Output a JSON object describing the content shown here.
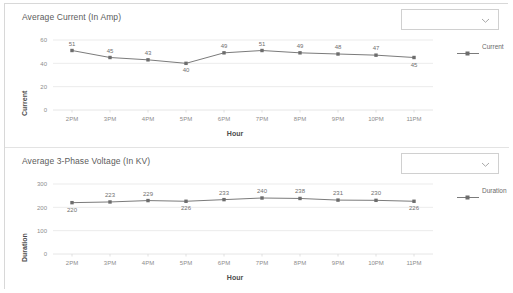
{
  "panels": [
    {
      "id": "average-current",
      "title": "Average Current (In Amp)",
      "dropdown": {
        "value": "",
        "icon": "chevron-down-icon"
      },
      "legend": {
        "label": "Current"
      },
      "chart_data": {
        "type": "line",
        "title": "Average Current (In Amp)",
        "xlabel": "Hour",
        "ylabel": "Current",
        "categories": [
          "2PM",
          "3PM",
          "4PM",
          "5PM",
          "6PM",
          "7PM",
          "8PM",
          "9PM",
          "10PM",
          "11PM"
        ],
        "series": [
          {
            "name": "Current",
            "values": [
              51,
              45,
              43,
              40,
              49,
              51,
              49,
              48,
              47,
              45
            ]
          }
        ],
        "data_labels": [
          "51",
          "45",
          "43",
          "40",
          "49",
          "51",
          "49",
          "48",
          "47",
          "45"
        ],
        "data_label_positions": [
          "above",
          "above",
          "above",
          "below",
          "above",
          "above",
          "above",
          "above",
          "above",
          "below"
        ],
        "yticks": [
          "0",
          "20",
          "40",
          "60"
        ],
        "ytick_values": [
          0,
          20,
          40,
          60
        ],
        "ylim": [
          0,
          60
        ],
        "grid": true,
        "legend_position": "right",
        "color": "#7b7b7b"
      }
    },
    {
      "id": "average-3-phase-voltage",
      "title": "Average 3-Phase Voltage (In KV)",
      "dropdown": {
        "value": "",
        "icon": "chevron-down-icon"
      },
      "legend": {
        "label": "Duration"
      },
      "chart_data": {
        "type": "line",
        "title": "Average 3-Phase Voltage (In KV)",
        "xlabel": "Hour",
        "ylabel": "Duration",
        "categories": [
          "2PM",
          "3PM",
          "4PM",
          "5PM",
          "6PM",
          "7PM",
          "8PM",
          "9PM",
          "10PM",
          "11PM"
        ],
        "series": [
          {
            "name": "Duration",
            "values": [
              220,
              223,
              229,
              226,
              233,
              240,
              238,
              231,
              230,
              226
            ]
          }
        ],
        "data_labels": [
          "220",
          "223",
          "229",
          "226",
          "233",
          "240",
          "238",
          "231",
          "230",
          "226"
        ],
        "data_label_positions": [
          "below",
          "above",
          "above",
          "below",
          "above",
          "above",
          "above",
          "above",
          "above",
          "below"
        ],
        "yticks": [
          "0",
          "100",
          "200",
          "300"
        ],
        "ytick_values": [
          0,
          100,
          200,
          300
        ],
        "ylim": [
          0,
          300
        ],
        "grid": true,
        "legend_position": "right",
        "color": "#7b7b7b"
      }
    }
  ]
}
